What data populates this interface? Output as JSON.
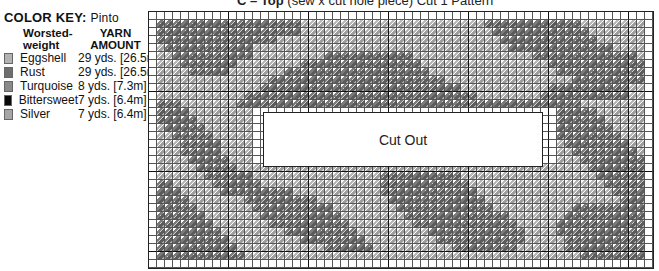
{
  "title": {
    "bold": "C – Top",
    "rest": " (sew x cut hole piece) Cut 1 Pattern"
  },
  "color_key": {
    "heading": "COLOR KEY:",
    "subheading": "Pinto",
    "col_yarn_type": "Worsted-weight",
    "col_amount": "YARN AMOUNT",
    "items": [
      {
        "name": "Eggshell",
        "amount": "29 yds. [26.5m]",
        "color": "#b3b3b3"
      },
      {
        "name": "Rust",
        "amount": "29 yds. [26.5m]",
        "color": "#6e6e6e"
      },
      {
        "name": "Turquoise",
        "amount": "8 yds. [7.3m]",
        "color": "#8a8a8a"
      },
      {
        "name": "Bittersweet",
        "amount": "7 yds. [6.4m]",
        "color": "#0a0a0a"
      },
      {
        "name": "Silver",
        "amount": "7 yds. [6.4m]",
        "color": "#a6a6a6"
      }
    ]
  },
  "chart": {
    "cols": 63,
    "rows": 32,
    "cell_px": 8,
    "major_every": 10,
    "cutout_label": "Cut Out",
    "rows_pattern": [
      "wwwwwwwwwwwwwwwwwwwwwwwwwwwwwwwwwwwwwwwwwwwwwwwwwwwwwwwwwwwwwww",
      "wDDDDDDDDDDDDDDDDDDLLLLLLLLLLLLLLLLLLLLLLLDDDDDDDDDDDDLLLLLLLLw",
      "wDDDDDDDDDDDDDDDDDDLLLLLLLLLLLLLLLLLLLLLLLLDDDDDDDDDDDDLLLLLLLw",
      "wDDDDDDDDDDDDDDDLLLLLLLLLLLLLLLLLLLLLLLLLLLLDDDDDDDDDDDDLLLLLLw",
      "wLDDDDDDDDDDDLLLLLLLLLLLLLLLLLLLLLLLLLLLLLLLLDDDDDDDDDDDDDLLLLw",
      "wLLDDDDDDDDDDLLLLLLLLLDDDDDDDDDDDLLLLLLLLLLLLLLLDDDDDDDDDDDDDLw",
      "wLLLDDDDDDDLLLLLLLLDDDDDDDDDDDDDDDLLLLLLLLLLLLLLLLDDDDDDDDDDDDw",
      "wLLLLDDDDDLLLLLLLDDDDDDDDDDDDDDDDDDLLLLLLLLLLLLLLLLDDDDDDDDDDDw",
      "wLLLLLLLLLLLLLLDDDDDDDDDDDDDDDDDDDDDDLLLLLLLLLLLLLLLLDDDDDDDDDw",
      "wLLLLLLLLLLLLLDDDDDDDDDDDDDDDDDDDDDDDDDLLLLLLLLLLLDDDDDDDDDDLLw",
      "wLLLLLLLLLLLDDDDDDDDDDDDDDDDDDDDDDDDDDDDDLLLLLLLLDDDDDDDDDDDLLw",
      "wDDDLLLLLLLDDDDDDDDDDDDDDDDDDDDDDDDDDDDDDDDDDDDDDDDDDDLLLLLLLLw",
      "wDDDDLLLLLLLLwwwwwwwwwwwwwwwwwwwwwwwwwwwwwwwwwwwwwwDDDDDLLLLLLw",
      "wDDDDDLLLLLLLwwwwwwwwwwwwwwwwwwwwwwwwwwwwwwwwwwwwwwDDDDDDLLLLLw",
      "wLDDDDDLLLLLLwwwwwwwwwwwwwwwwwwwwwwwwwwwwwwwwwwwwwwDDDDDDDLLLLw",
      "wLLDDDDDLLLLLwwwwwwwwwwwwwwwwwwwwwwwwwwwwwwwwwwwwwwDDDDDDDDLLLw",
      "wLLLDDDDDLLLLwwwwwwwwwwwwwwwwwwwwwwwwwwwwwwwwwwwwwwLDDDDDDDDLLw",
      "wLLLDDDDDLLLLwwwwwwwwwwwwwwwwwwwwwwwwwwwwwwwwwwwwwwLLDDDDDDDDLw",
      "wLLLLDDDDDLLLwwwwwwwwwwwwwwwwwwwwwwwwwwwwwwwwwwwwwwLLLDDDDDDDDw",
      "wLLLLLDDDDDLLLLLLLLLLLLLLLLLLLLLLLLLLLLLLLLLLLLLLLLLLLLDDDDDDDw",
      "wLLLLLLDDDDDDLLLLLLLLLLLLLLLLDDDDDDDDDDLLLLLLLLLLLLLLLLLDDDDDDw",
      "wDDLLLLLDDDDDDLLLLLLLLLLLLLLLDDDDDDDDDDDLLLLLLLLLLLLLLLLLDDDDDw",
      "wDDDLLLLLDDDDDDDDDLLLLLLLLLLLDDDDDDDDDDDDLLLLLLLLLLLLLLLLLDDDDw",
      "wDDDDLLLLLLLDDDDDDDDDLLLLLLLLLDDDDDDDDDDDDLLLLLLLLLLLLLLLLLDDDw",
      "wDDDDDLLLLLLLDDDDDDDDDDLLLLLLLLDDDDDDDDDDDDLLLLLLLLLLDDDDDDDDDw",
      "wDDDDDDLLLLLLLDDDDDDDDDDLLLLLLLLDDDDDDDDDDDDDLLLLLLLDDDDDDDDDDw",
      "wDDDDDDDLLLLLLLDDDDDDDDDDLLLLLLLLDDDDDDDDDDDDDLLLLLDDDDDDDDDDDw",
      "wDDDDDDDDLLLLLLLLDDDDDDDDDLLLLLLLLLDDDDDDDDDDDDLLLLDDDDDDDDDDDw",
      "wDDDDDDDDDLLLLLLLLLDDDDDDDDLLLLLLLLLDDDDDDDDDDDLLLLLDDDDDDDDDDw",
      "wDDDDDDDDDDLLLLLLLLLLLDDDDDDLLLLLLLLLLDDDDDDDDLLLLLLDDDDDDDDDDw",
      "wDDDDDDDDDDDLLLLLLLLLLLLLLLLLLLLLLLLLLLLLLLLLLLLLLLLLLDDDDDDDDw",
      "wwwwwwwwwwwwwwwwwwwwwwwwwwwwwwwwwwwwwwwwwwwwwwwwwwwwwwwwwwwwwww"
    ]
  }
}
